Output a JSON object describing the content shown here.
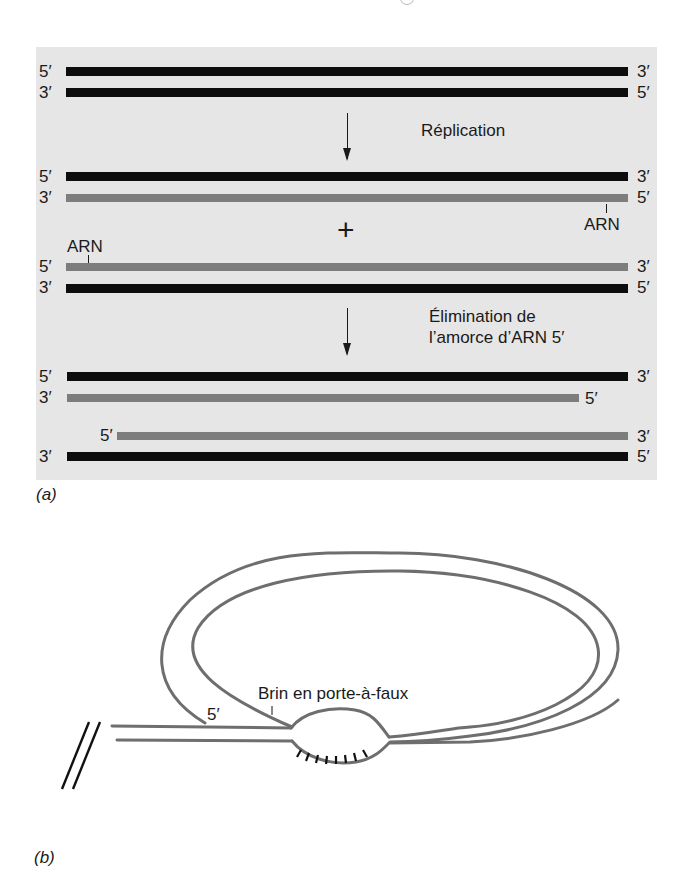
{
  "figure": {
    "panel_a": {
      "tag": "(a)",
      "background": "#e6e6e6",
      "colors": {
        "dna": "#0d0d0d",
        "rna": "#7d7d7d"
      },
      "stage1": {
        "top": {
          "left": "5′",
          "right": "3′",
          "type": "dna"
        },
        "bottom": {
          "left": "3′",
          "right": "5′",
          "type": "dna"
        }
      },
      "step1_label": "Réplication",
      "stage2": {
        "duplex1": {
          "top": {
            "left": "5′",
            "right": "3′",
            "type": "dna"
          },
          "bottom": {
            "left": "3′",
            "right": "5′",
            "type": "rna",
            "primer_label": "ARN"
          }
        },
        "plus": "+",
        "duplex2": {
          "top": {
            "left": "5′",
            "right": "3′",
            "type": "rna",
            "primer_label": "ARN"
          },
          "bottom": {
            "left": "3′",
            "right": "5′",
            "type": "dna"
          }
        }
      },
      "step2_label_line1": "Élimination de",
      "step2_label_line2": "l’amorce d’ARN 5′",
      "stage3": {
        "duplex1": {
          "top": {
            "left": "5′",
            "right": "3′",
            "type": "dna"
          },
          "bottom": {
            "left": "3′",
            "right": "5′",
            "type": "rna",
            "note": "shortened 5′ end"
          }
        },
        "duplex2": {
          "top": {
            "left": "5′",
            "right": "3′",
            "type": "rna",
            "note": "shortened 5′ end"
          },
          "bottom": {
            "left": "3′",
            "right": "5′",
            "type": "dna"
          }
        }
      }
    },
    "panel_b": {
      "tag": "(b)",
      "overhang_label": "Brin en porte-à-faux",
      "end_label": "5′",
      "stroke_color": "#6e6e6e"
    }
  }
}
